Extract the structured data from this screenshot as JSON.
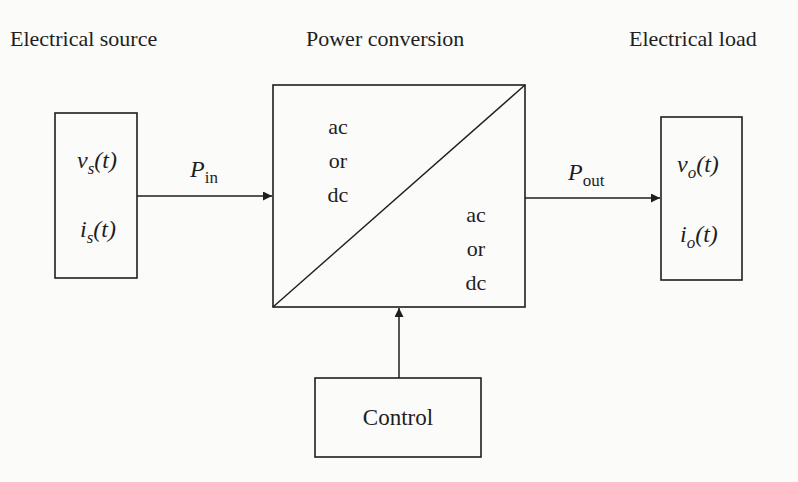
{
  "headings": {
    "source": "Electrical source",
    "conversion": "Power conversion",
    "load": "Electrical load"
  },
  "source_block": {
    "voltage": {
      "sym": "v",
      "sub": "s",
      "arg": "(t)"
    },
    "current": {
      "sym": "i",
      "sub": "s",
      "arg": "(t)"
    }
  },
  "input_power": {
    "sym": "P",
    "sub": "in"
  },
  "converter": {
    "input_type": [
      "ac",
      "or",
      "dc"
    ],
    "output_type": [
      "ac",
      "or",
      "dc"
    ]
  },
  "output_power": {
    "sym": "P",
    "sub": "out"
  },
  "load_block": {
    "voltage": {
      "sym": "v",
      "sub": "o",
      "arg": "(t)"
    },
    "current": {
      "sym": "i",
      "sub": "o",
      "arg": "(t)"
    }
  },
  "control_block": {
    "label": "Control"
  },
  "colors": {
    "line": "#1e1e1e",
    "background": "#fbfbfa"
  }
}
